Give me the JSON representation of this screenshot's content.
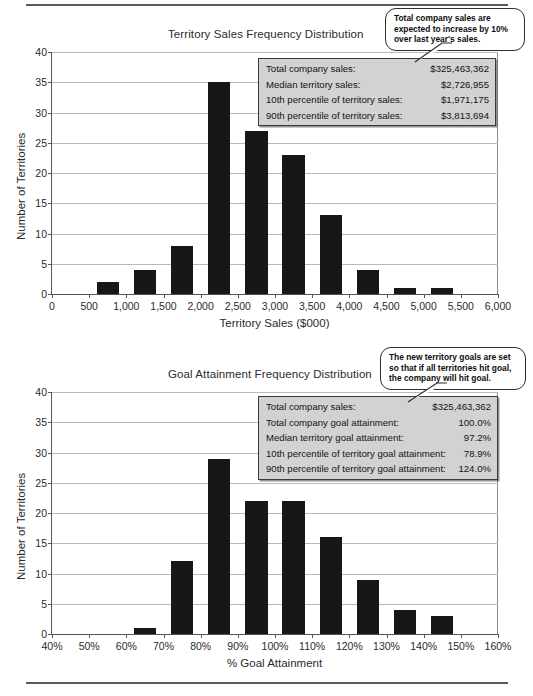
{
  "document": {
    "rule_top": "horizontal-rule",
    "rule_bottom": "horizontal-rule"
  },
  "chart1": {
    "title": "Territory Sales Frequency Distribution",
    "xlabel": "Territory Sales ($000)",
    "ylabel": "Number of Territories",
    "callout": "Total company sales are expected to increase by 10% over last year's sales.",
    "stats": [
      {
        "label": "Total company sales:",
        "value": "$325,463,362"
      },
      {
        "label": "Median territory sales:",
        "value": "$2,726,955"
      },
      {
        "label": "10th percentile of territory sales:",
        "value": "$1,971,175"
      },
      {
        "label": "90th percentile of territory sales:",
        "value": "$3,813,694"
      }
    ]
  },
  "chart2": {
    "title": "Goal Attainment Frequency Distribution",
    "xlabel": "% Goal Attainment",
    "ylabel": "Number of Territories",
    "callout": "The new territory goals are set so that if all territories hit goal, the company will hit goal.",
    "stats": [
      {
        "label": "Total company sales:",
        "value": "$325,463,362"
      },
      {
        "label": "Total company goal attainment:",
        "value": "100.0%"
      },
      {
        "label": "Median territory goal attainment:",
        "value": "97.2%"
      },
      {
        "label": "10th percentile of territory goal attainment:",
        "value": "78.9%"
      },
      {
        "label": "90th percentile of territory goal attainment:",
        "value": "124.0%"
      }
    ]
  },
  "chart_data": [
    {
      "type": "bar",
      "title": "Territory Sales Frequency Distribution",
      "xlabel": "Territory Sales ($000)",
      "ylabel": "Number of Territories",
      "xlim": [
        0,
        6000
      ],
      "ylim": [
        0,
        40
      ],
      "yticks": [
        0,
        5,
        10,
        15,
        20,
        25,
        30,
        35,
        40
      ],
      "xticks": [
        0,
        500,
        1000,
        1500,
        2000,
        2500,
        3000,
        3500,
        4000,
        4500,
        5000,
        5500,
        6000
      ],
      "xtick_labels": [
        "0",
        "500",
        "1,000",
        "1,500",
        "2,000",
        "2,500",
        "3,000",
        "3,500",
        "4,000",
        "4,500",
        "5,000",
        "5,500",
        "6,000"
      ],
      "grid": "horizontal",
      "legend": "none",
      "bin_width": 500,
      "bins": [
        {
          "start": 0,
          "end": 500,
          "value": 0
        },
        {
          "start": 500,
          "end": 1000,
          "value": 2
        },
        {
          "start": 1000,
          "end": 1500,
          "value": 4
        },
        {
          "start": 1500,
          "end": 2000,
          "value": 8
        },
        {
          "start": 2000,
          "end": 2500,
          "value": 35
        },
        {
          "start": 2500,
          "end": 3000,
          "value": 27
        },
        {
          "start": 3000,
          "end": 3500,
          "value": 23
        },
        {
          "start": 3500,
          "end": 4000,
          "value": 13
        },
        {
          "start": 4000,
          "end": 4500,
          "value": 4
        },
        {
          "start": 4500,
          "end": 5000,
          "value": 1
        },
        {
          "start": 5000,
          "end": 5500,
          "value": 1
        },
        {
          "start": 5500,
          "end": 6000,
          "value": 0
        }
      ],
      "annotations": [
        "Total company sales are expected to increase by 10% over last year's sales."
      ]
    },
    {
      "type": "bar",
      "title": "Goal Attainment Frequency Distribution",
      "xlabel": "% Goal Attainment",
      "ylabel": "Number of Territories",
      "xlim": [
        40,
        160
      ],
      "ylim": [
        0,
        40
      ],
      "yticks": [
        0,
        5,
        10,
        15,
        20,
        25,
        30,
        35,
        40
      ],
      "xticks": [
        40,
        50,
        60,
        70,
        80,
        90,
        100,
        110,
        120,
        130,
        140,
        150,
        160
      ],
      "xtick_labels": [
        "40%",
        "50%",
        "60%",
        "70%",
        "80%",
        "90%",
        "100%",
        "110%",
        "120%",
        "130%",
        "140%",
        "150%",
        "160%"
      ],
      "grid": "horizontal",
      "legend": "none",
      "bin_width": 10,
      "bins": [
        {
          "start": 40,
          "end": 50,
          "value": 0
        },
        {
          "start": 50,
          "end": 60,
          "value": 0
        },
        {
          "start": 60,
          "end": 70,
          "value": 1
        },
        {
          "start": 70,
          "end": 80,
          "value": 12
        },
        {
          "start": 80,
          "end": 90,
          "value": 29
        },
        {
          "start": 90,
          "end": 100,
          "value": 22
        },
        {
          "start": 100,
          "end": 110,
          "value": 22
        },
        {
          "start": 110,
          "end": 120,
          "value": 16
        },
        {
          "start": 120,
          "end": 130,
          "value": 9
        },
        {
          "start": 130,
          "end": 140,
          "value": 4
        },
        {
          "start": 140,
          "end": 150,
          "value": 3
        },
        {
          "start": 150,
          "end": 160,
          "value": 0
        }
      ],
      "annotations": [
        "The new territory goals are set so that if all territories hit goal, the company will hit goal."
      ]
    }
  ]
}
